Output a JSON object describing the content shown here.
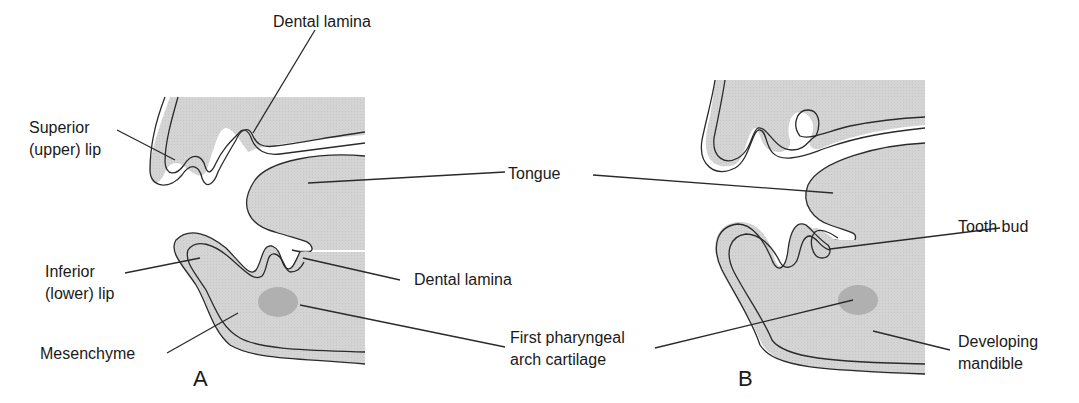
{
  "figure": {
    "colors": {
      "tissue": "#d6d6d6",
      "epithelium": "#d9d9d9",
      "cartilage": "#a9a9a9",
      "outline": "#2a2a2a",
      "background": "#ffffff"
    },
    "panels": [
      {
        "letter": "A",
        "labels": {
          "dental_lamina_upper": "Dental lamina",
          "superior_lip_line1": "Superior",
          "superior_lip_line2": "(upper) lip",
          "inferior_lip_line1": "Inferior",
          "inferior_lip_line2": "(lower) lip",
          "mesenchyme": "Mesenchyme",
          "dental_lamina_lower": "Dental lamina"
        }
      },
      {
        "letter": "B",
        "labels": {
          "tooth_bud": "Tooth bud",
          "developing_mandible_line1": "Developing",
          "developing_mandible_line2": "mandible"
        }
      }
    ],
    "shared_labels": {
      "tongue": "Tongue",
      "cartilage_line1": "First pharyngeal",
      "cartilage_line2": "arch cartilage"
    }
  }
}
